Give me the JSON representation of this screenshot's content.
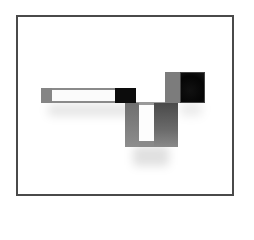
{
  "image": {
    "description": "Product photo of a modular wall shelf (horizontal bar shelf with a U-shaped box and a cube) inside a thin dark gray framed border",
    "frame_color": "#4a4a4a",
    "background_color": "#ffffff",
    "colors": {
      "gray_light": "#8a8a8a",
      "gray_mid": "#7a7a7a",
      "gray_dark": "#5a5a5a",
      "black": "#0c0c0c",
      "white_inner": "#fbfbfb"
    }
  }
}
